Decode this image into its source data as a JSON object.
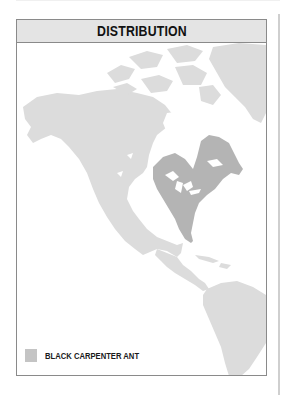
{
  "header": {
    "title": "DISTRIBUTION"
  },
  "map": {
    "region": "North and South America",
    "land_color": "#dcdcdc",
    "range_color": "#b4b4b4",
    "water_color": "#ffffff"
  },
  "legend": {
    "items": [
      {
        "label": "BLACK CARPENTER ANT",
        "color": "#c4c4c4"
      }
    ]
  }
}
